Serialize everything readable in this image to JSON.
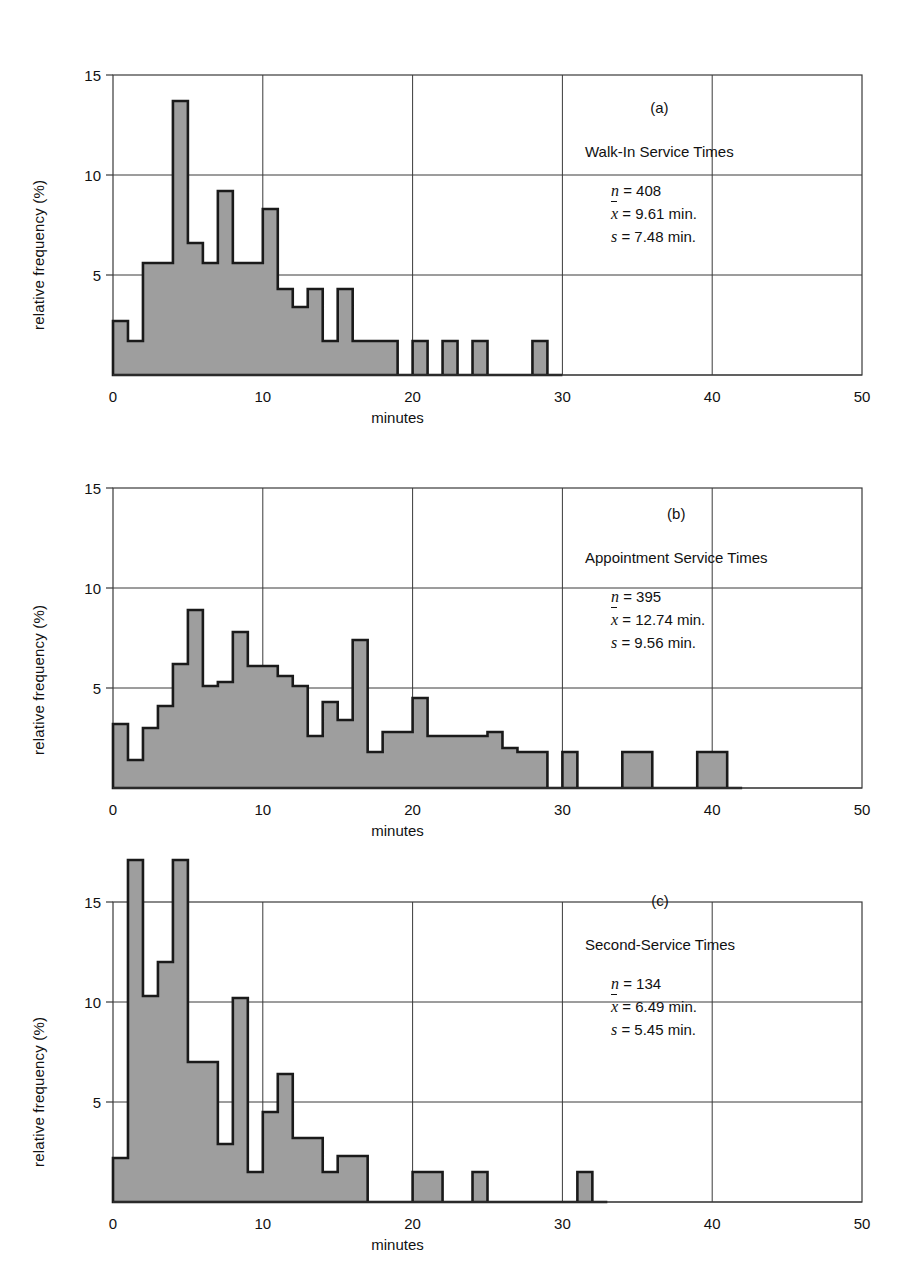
{
  "figure": {
    "y_axis_label": "relative frequency (%)",
    "x_axis_label": "minutes",
    "x_ticks": [
      "0",
      "10",
      "20",
      "30",
      "40",
      "50"
    ],
    "y_ticks": [
      "5",
      "10",
      "15"
    ],
    "bar_fill_color": "#9e9e9e",
    "bar_stroke_color": "#1a1a1a",
    "grid_color": "#3a3a3a",
    "background_color": "#ffffff"
  },
  "panels": [
    {
      "letter": "(a)",
      "title": "Walk-In Service Times",
      "stats": {
        "n_symbol": "n",
        "n_value": "= 408",
        "mean_symbol": "x",
        "mean_value": "= 9.61 min.",
        "sd_symbol": "s",
        "sd_value": "= 7.48 min."
      }
    },
    {
      "letter": "(b)",
      "title": "Appointment Service Times",
      "stats": {
        "n_symbol": "n",
        "n_value": "= 395",
        "mean_symbol": "x",
        "mean_value": "= 12.74 min.",
        "sd_symbol": "s",
        "sd_value": "= 9.56 min."
      }
    },
    {
      "letter": "(c)",
      "title": "Second-Service Times",
      "stats": {
        "n_symbol": "n",
        "n_value": "= 134",
        "mean_symbol": "x",
        "mean_value": "= 6.49 min.",
        "sd_symbol": "s",
        "sd_value": "= 5.45 min."
      }
    }
  ],
  "chart_data": [
    {
      "type": "bar",
      "title": "Walk-In Service Times",
      "panel": "(a)",
      "xlabel": "minutes",
      "ylabel": "relative frequency (%)",
      "xlim": [
        0,
        50
      ],
      "ylim": [
        0,
        15.5
      ],
      "bin_width": 1,
      "grid": true,
      "x_ticks": [
        0,
        10,
        20,
        30,
        40,
        50
      ],
      "y_ticks": [
        5,
        10,
        15
      ],
      "bin_starts": [
        0,
        1,
        2,
        3,
        4,
        5,
        6,
        7,
        8,
        9,
        10,
        11,
        12,
        13,
        14,
        15,
        16,
        17,
        18,
        19,
        20,
        21,
        22,
        23,
        24,
        25,
        26,
        27,
        28,
        29
      ],
      "values": [
        2.7,
        1.7,
        5.6,
        5.6,
        13.7,
        6.6,
        5.6,
        9.2,
        5.6,
        5.6,
        8.3,
        4.3,
        3.4,
        4.3,
        1.7,
        4.3,
        1.7,
        1.7,
        1.7,
        0,
        1.7,
        0,
        1.7,
        0,
        1.7,
        0,
        0,
        0,
        1.7,
        0
      ],
      "n": 408,
      "mean": 9.61,
      "sd": 7.48
    },
    {
      "type": "bar",
      "title": "Appointment Service Times",
      "panel": "(b)",
      "xlabel": "minutes",
      "ylabel": "relative frequency (%)",
      "xlim": [
        0,
        50
      ],
      "ylim": [
        0,
        15.5
      ],
      "bin_width": 1,
      "grid": true,
      "x_ticks": [
        0,
        10,
        20,
        30,
        40,
        50
      ],
      "y_ticks": [
        5,
        10,
        15
      ],
      "bin_starts": [
        0,
        1,
        2,
        3,
        4,
        5,
        6,
        7,
        8,
        9,
        10,
        11,
        12,
        13,
        14,
        15,
        16,
        17,
        18,
        19,
        20,
        21,
        22,
        23,
        24,
        25,
        26,
        27,
        28,
        29,
        30,
        31,
        32,
        33,
        34,
        35,
        36,
        37,
        38,
        39,
        40,
        41
      ],
      "values": [
        3.2,
        1.4,
        3.0,
        4.1,
        6.2,
        8.9,
        5.1,
        5.3,
        7.8,
        6.1,
        6.1,
        5.6,
        5.1,
        2.6,
        4.3,
        3.4,
        7.4,
        1.8,
        2.8,
        2.8,
        4.5,
        2.6,
        2.6,
        2.6,
        2.6,
        2.8,
        2.0,
        1.8,
        1.8,
        0,
        1.8,
        0,
        0,
        0,
        1.8,
        1.8,
        0,
        0,
        0,
        1.8,
        1.8,
        0
      ],
      "n": 395,
      "mean": 12.74,
      "sd": 9.56
    },
    {
      "type": "bar",
      "title": "Second-Service Times",
      "panel": "(c)",
      "xlabel": "minutes",
      "ylabel": "relative frequency (%)",
      "xlim": [
        0,
        50
      ],
      "ylim": [
        0,
        18.5
      ],
      "bin_width": 1,
      "grid": true,
      "x_ticks": [
        0,
        10,
        20,
        30,
        40,
        50
      ],
      "y_ticks": [
        5,
        10,
        15
      ],
      "bin_starts": [
        0,
        1,
        2,
        3,
        4,
        5,
        6,
        7,
        8,
        9,
        10,
        11,
        12,
        13,
        14,
        15,
        16,
        17,
        18,
        19,
        20,
        21,
        22,
        23,
        24,
        25,
        26,
        27,
        28,
        29,
        30,
        31,
        32
      ],
      "values": [
        2.2,
        17.1,
        10.3,
        12.0,
        17.1,
        7.0,
        7.0,
        2.9,
        10.2,
        1.5,
        4.5,
        6.4,
        3.2,
        3.2,
        1.5,
        2.3,
        2.3,
        0,
        0,
        0,
        1.5,
        1.5,
        0,
        0,
        1.5,
        0,
        0,
        0,
        0,
        0,
        0,
        1.5,
        0
      ],
      "n": 134,
      "mean": 6.49,
      "sd": 5.45
    }
  ]
}
